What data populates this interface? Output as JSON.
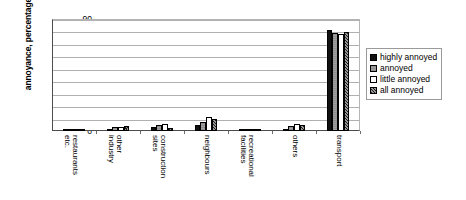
{
  "chart_data": {
    "type": "bar",
    "title": "",
    "xlabel": "",
    "ylabel": "annoyance, percentage",
    "ylim": [
      0,
      90
    ],
    "ytick_step": 10,
    "yticks": [
      90,
      80,
      70,
      60,
      50,
      40,
      30,
      20,
      10,
      0
    ],
    "grid": true,
    "legend_position": "right",
    "categories": [
      "restaurants\netc.",
      "other\nindustry",
      "construction\nsites",
      "neighbours",
      "recreational\nfacilities",
      "others",
      "transport"
    ],
    "series": [
      {
        "name": "highly annoyed",
        "values": [
          0.6,
          2.0,
          3.0,
          5.0,
          0.8,
          2.0,
          81.5
        ]
      },
      {
        "name": "annoyed",
        "values": [
          0.8,
          3.5,
          4.5,
          7.5,
          1.2,
          4.0,
          78.5
        ]
      },
      {
        "name": "little annoyed",
        "values": [
          0.7,
          3.0,
          6.0,
          11.5,
          1.0,
          5.5,
          78.0
        ]
      },
      {
        "name": "all annoyed",
        "values": [
          1.0,
          4.0,
          2.5,
          10.0,
          1.5,
          5.0,
          79.5
        ]
      }
    ]
  },
  "legend": {
    "items": [
      {
        "label": "highly annoyed",
        "swatch": "solid-black",
        "color": "#111111"
      },
      {
        "label": "annoyed",
        "swatch": "gray-hatched",
        "color": "#8c8c8c"
      },
      {
        "label": "little annoyed",
        "swatch": "white",
        "color": "#ffffff"
      },
      {
        "label": "all annoyed",
        "swatch": "black-checker",
        "color": "#1a1a1a"
      }
    ]
  }
}
